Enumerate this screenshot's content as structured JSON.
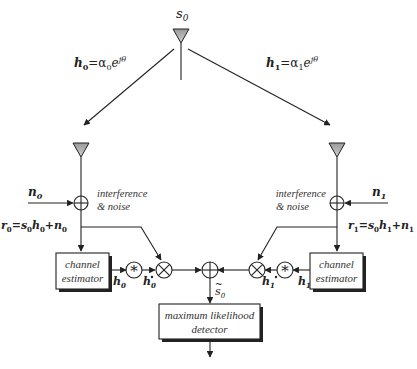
{
  "diagram": {
    "transmit": {
      "symbol": "s",
      "symbol_sub": "0"
    },
    "channels": [
      {
        "label_main": "h",
        "label_sub": "0",
        "label_eq": "=α",
        "label_eq_sub": "0",
        "label_exp_base": "e",
        "label_exp": "jθ",
        "label_exp_sub": "0"
      },
      {
        "label_main": "h",
        "label_sub": "1",
        "label_eq": "=α",
        "label_eq_sub": "1",
        "label_exp_base": "e",
        "label_exp": "jθ",
        "label_exp_sub": "1"
      }
    ],
    "noise": [
      {
        "symbol": "n",
        "sub": "0"
      },
      {
        "symbol": "n",
        "sub": "1"
      }
    ],
    "noise_note_line1": "interference",
    "noise_note_line2": "& noise",
    "received": [
      {
        "r": "r",
        "r_sub": "0",
        "eq": "=s",
        "s_sub": "0",
        "h": "h",
        "h_sub": "0",
        "plus": "+n",
        "n_sub": "0"
      },
      {
        "r": "r",
        "r_sub": "1",
        "eq": "=s",
        "s_sub": "0",
        "h": "h",
        "h_sub": "1",
        "plus": "+n",
        "n_sub": "1"
      }
    ],
    "estimator": {
      "line1": "channel",
      "line2": "estimator"
    },
    "conj_symbol": "*",
    "estimates": [
      {
        "h": "h",
        "sub": "0",
        "conj_mark": "*"
      },
      {
        "h": "h",
        "sub": "1",
        "conj_mark": "*"
      }
    ],
    "combined": {
      "symbol": "s",
      "sub": "0",
      "accent": "~"
    },
    "detector": {
      "line1": "maximum likelihood",
      "line2": "detector"
    },
    "colors": {
      "antenna_fill": "#b8b8b8",
      "line": "#222222"
    }
  }
}
